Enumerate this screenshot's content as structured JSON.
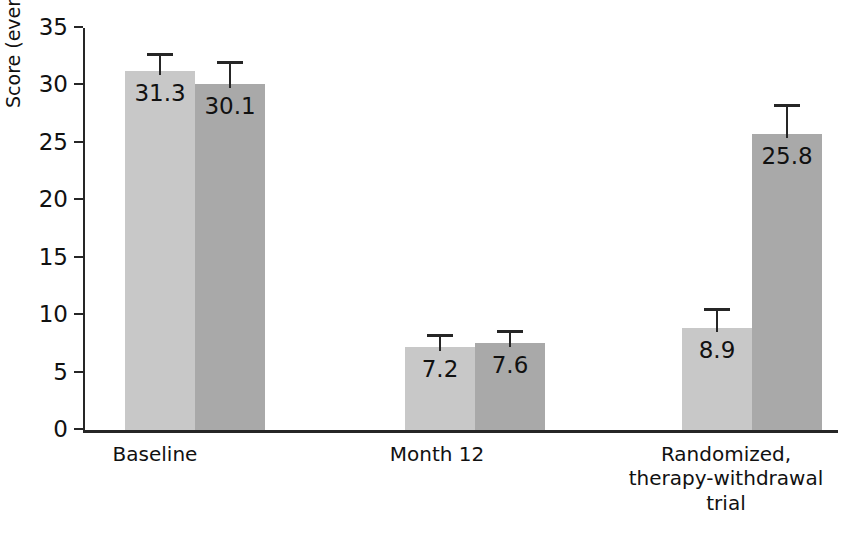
{
  "figure": {
    "crop_artifact_text": "",
    "background_color": "#ffffff"
  },
  "axes": {
    "y_title": "Score (events/hr)",
    "y_ticks": [
      "0",
      "5",
      "10",
      "15",
      "20",
      "25",
      "30",
      "35"
    ],
    "x_categories": [
      {
        "lines": [
          "Baseline"
        ]
      },
      {
        "lines": [
          "Month 12"
        ]
      },
      {
        "lines": [
          "Randomized,",
          "therapy-withdrawal",
          "trial"
        ]
      }
    ]
  },
  "bars": {
    "baseline": {
      "a": {
        "label": "31.3",
        "value": 31.3,
        "err_high": 32.8
      },
      "b": {
        "label": "30.1",
        "value": 30.1,
        "err_high": 32.1
      }
    },
    "month12": {
      "a": {
        "label": "7.2",
        "value": 7.2,
        "err_high": 8.4
      },
      "b": {
        "label": "7.6",
        "value": 7.6,
        "err_high": 8.7
      }
    },
    "withdrawal": {
      "a": {
        "label": "8.9",
        "value": 8.9,
        "err_high": 10.6
      },
      "b": {
        "label": "25.8",
        "value": 25.8,
        "err_high": 28.4
      }
    }
  },
  "colors": {
    "series_a": "#c8c8c8",
    "series_b": "#a9a9a9",
    "axis": "#262626",
    "text": "#111111"
  },
  "chart_data": {
    "type": "bar",
    "title": "",
    "subtitle": "",
    "xlabel": "",
    "ylabel": "Score (events/hr)",
    "ylim": [
      0,
      35
    ],
    "ytick_step": 5,
    "yticks": [
      0,
      5,
      10,
      15,
      20,
      25,
      30,
      35
    ],
    "grid": false,
    "legend": "none",
    "orientation": "vertical",
    "grouping": "grouped",
    "error_bars": "upper only (capped)",
    "data_labels": "inside bar, near top",
    "categories": [
      "Baseline",
      "Month 12",
      "Randomized, therapy-withdrawal trial"
    ],
    "series": [
      {
        "name": "Series A (light gray)",
        "color": "#c8c8c8",
        "values": [
          31.3,
          7.2,
          8.9
        ],
        "error_high": [
          32.8,
          8.4,
          10.6
        ]
      },
      {
        "name": "Series B (dark gray)",
        "color": "#a9a9a9",
        "values": [
          30.1,
          7.6,
          25.8
        ],
        "error_high": [
          32.1,
          8.7,
          28.4
        ]
      }
    ],
    "annotations": [
      {
        "text": "31.3",
        "category": "Baseline",
        "series": "Series A (light gray)"
      },
      {
        "text": "30.1",
        "category": "Baseline",
        "series": "Series B (dark gray)"
      },
      {
        "text": "7.2",
        "category": "Month 12",
        "series": "Series A (light gray)"
      },
      {
        "text": "7.6",
        "category": "Month 12",
        "series": "Series B (dark gray)"
      },
      {
        "text": "8.9",
        "category": "Randomized, therapy-withdrawal trial",
        "series": "Series A (light gray)"
      },
      {
        "text": "25.8",
        "category": "Randomized, therapy-withdrawal trial",
        "series": "Series B (dark gray)"
      }
    ]
  }
}
